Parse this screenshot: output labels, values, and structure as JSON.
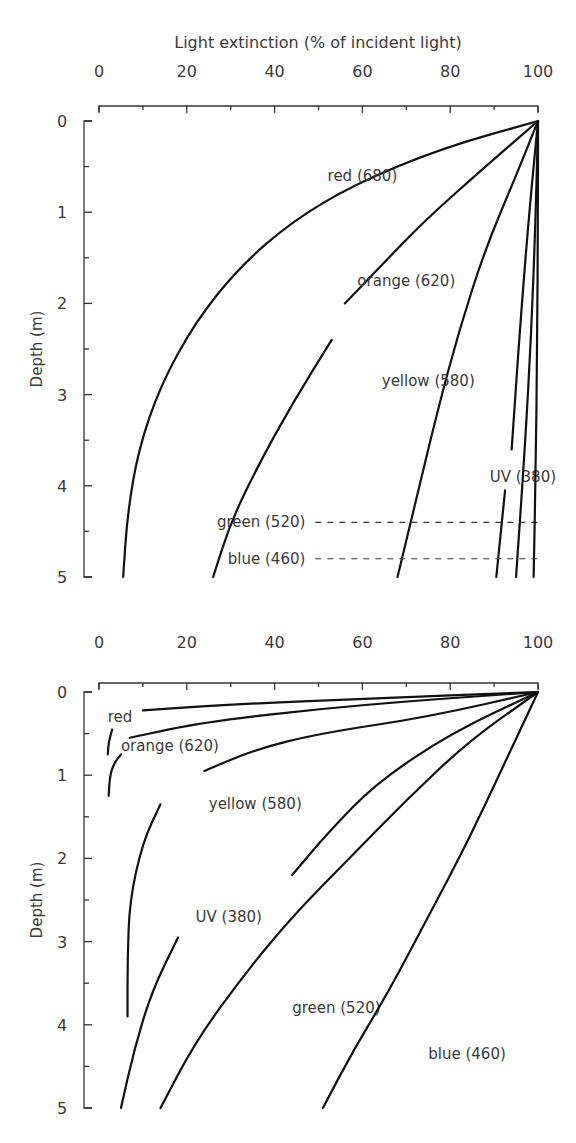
{
  "chart_data": [
    {
      "type": "line",
      "title": "Light extinction (% of incident light)",
      "xlabel": "Light extinction (% of incident light)",
      "ylabel": "Depth (m)",
      "xlim": [
        0,
        100
      ],
      "ylim": [
        0,
        5
      ],
      "x_ticks": [
        "0",
        "20",
        "40",
        "60",
        "80",
        "100"
      ],
      "y_ticks": [
        "0",
        "1",
        "2",
        "3",
        "4",
        "5"
      ],
      "y_inverted": true,
      "series": [
        {
          "name": "red (680)",
          "points": [
            [
              100,
              0
            ],
            [
              78,
              0.3
            ],
            [
              58,
              0.7
            ],
            [
              44,
              1.1
            ],
            [
              32,
              1.6
            ],
            [
              22,
              2.2
            ],
            [
              14,
              2.9
            ],
            [
              9,
              3.6
            ],
            [
              6.5,
              4.3
            ],
            [
              5.5,
              5
            ]
          ],
          "label_pos": [
            60,
            0.6
          ]
        },
        {
          "name": "orange (620)",
          "points": [
            [
              100,
              0
            ],
            [
              88,
              0.5
            ],
            [
              74,
              1.1
            ],
            [
              64,
              1.6
            ],
            [
              56,
              2.0
            ]
          ],
          "points2": [
            [
              53,
              2.4
            ],
            [
              44,
              3.1
            ],
            [
              36,
              3.8
            ],
            [
              30,
              4.4
            ],
            [
              26,
              5
            ]
          ],
          "label_pos": [
            70,
            1.75
          ]
        },
        {
          "name": "yellow (580)",
          "points": [
            [
              100,
              0
            ],
            [
              95,
              0.6
            ],
            [
              88,
              1.4
            ],
            [
              82,
              2.3
            ],
            [
              77,
              3.2
            ],
            [
              72,
              4.2
            ],
            [
              68,
              5
            ]
          ],
          "label_pos": [
            75,
            2.85
          ]
        },
        {
          "name": "UV (380)",
          "points": [
            [
              100,
              0
            ],
            [
              98,
              1.0
            ],
            [
              96,
              2.2
            ],
            [
              94,
              3.6
            ]
          ],
          "points2": [
            [
              92.5,
              4.05
            ],
            [
              90.5,
              5
            ]
          ],
          "label_pos": [
            89,
            3.9
          ]
        },
        {
          "name": "green (520)",
          "points": [
            [
              100,
              0
            ],
            [
              99.5,
              1
            ],
            [
              98.5,
              2.3
            ],
            [
              97,
              3.6
            ],
            [
              95,
              5
            ]
          ],
          "label_pos": [
            47,
            4.4
          ],
          "dash_y": 4.4
        },
        {
          "name": "blue (460)",
          "points": [
            [
              100,
              0
            ],
            [
              100,
              1
            ],
            [
              99.8,
              2.5
            ],
            [
              99.5,
              3.8
            ],
            [
              99,
              5
            ]
          ],
          "label_pos": [
            47,
            4.8
          ],
          "dash_y": 4.8
        }
      ]
    },
    {
      "type": "line",
      "title": "",
      "xlabel": "",
      "ylabel": "Depth (m)",
      "xlim": [
        0,
        100
      ],
      "ylim": [
        0,
        5
      ],
      "x_ticks": [
        "0",
        "20",
        "40",
        "60",
        "80",
        "100"
      ],
      "y_ticks": [
        "0",
        "1",
        "2",
        "3",
        "4",
        "5"
      ],
      "y_inverted": true,
      "series": [
        {
          "name": "red",
          "points": [
            [
              100,
              0
            ],
            [
              60,
              0.08
            ],
            [
              30,
              0.15
            ],
            [
              10,
              0.22
            ]
          ],
          "points2": [
            [
              3,
              0.45
            ],
            [
              2.2,
              0.6
            ],
            [
              2,
              0.75
            ]
          ],
          "label_pos": [
            2,
            0.3
          ]
        },
        {
          "name": "orange (620)",
          "points": [
            [
              100,
              0
            ],
            [
              60,
              0.15
            ],
            [
              25,
              0.35
            ],
            [
              7,
              0.55
            ]
          ],
          "points2": [
            [
              5,
              0.75
            ],
            [
              3.5,
              0.85
            ],
            [
              2.5,
              1.0
            ],
            [
              2.2,
              1.25
            ]
          ],
          "label_pos": [
            5,
            0.65
          ]
        },
        {
          "name": "yellow (580)",
          "points": [
            [
              100,
              0
            ],
            [
              75,
              0.3
            ],
            [
              50,
              0.5
            ],
            [
              35,
              0.7
            ],
            [
              24,
              0.95
            ]
          ],
          "points2": [
            [
              14,
              1.35
            ],
            [
              10,
              1.8
            ],
            [
              7,
              2.5
            ],
            [
              6.5,
              3.2
            ],
            [
              6.5,
              3.9
            ]
          ],
          "label_pos": [
            25,
            1.35
          ]
        },
        {
          "name": "UV (380)",
          "points": [
            [
              100,
              0
            ],
            [
              80,
              0.5
            ],
            [
              63,
              1.1
            ],
            [
              52,
              1.7
            ],
            [
              44,
              2.2
            ]
          ],
          "points2": [
            [
              18,
              2.95
            ],
            [
              12,
              3.6
            ],
            [
              8,
              4.3
            ],
            [
              5,
              5
            ]
          ],
          "label_pos": [
            22,
            2.7
          ]
        },
        {
          "name": "green (520)",
          "points": [
            [
              100,
              0
            ],
            [
              84,
              0.6
            ],
            [
              70,
              1.3
            ],
            [
              57,
              2.0
            ],
            [
              44,
              2.7
            ],
            [
              33,
              3.4
            ],
            [
              22,
              4.2
            ],
            [
              14,
              5
            ]
          ],
          "label_pos": [
            44,
            3.8
          ]
        },
        {
          "name": "blue (460)",
          "points": [
            [
              100,
              0
            ],
            [
              92,
              0.9
            ],
            [
              84,
              1.8
            ],
            [
              75,
              2.7
            ],
            [
              66,
              3.6
            ],
            [
              58,
              4.3
            ],
            [
              51,
              5
            ]
          ],
          "label_pos": [
            75,
            4.35
          ]
        }
      ]
    }
  ],
  "labels": {
    "top_title": "Light extinction (% of incident light)",
    "ylabel": "Depth (m)"
  }
}
